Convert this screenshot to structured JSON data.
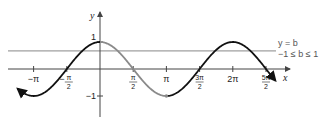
{
  "figure": {
    "function": "y = cos x",
    "highlight_interval": "[0, π]",
    "axes": {
      "x_label": "x",
      "y_label": "y"
    },
    "x_ticks": [
      {
        "value": -3.14159,
        "label": "−π",
        "kind": "plain"
      },
      {
        "value": -1.5708,
        "num": "π",
        "den": "2",
        "sign": "−",
        "kind": "frac"
      },
      {
        "value": 1.5708,
        "num": "π",
        "den": "2",
        "sign": "",
        "kind": "frac"
      },
      {
        "value": 3.14159,
        "label": "π",
        "kind": "plain"
      },
      {
        "value": 4.71239,
        "num": "3π",
        "den": "2",
        "sign": "",
        "kind": "frac"
      },
      {
        "value": 6.28319,
        "label": "2π",
        "kind": "plain"
      },
      {
        "value": 7.85398,
        "num": "5π",
        "den": "2",
        "sign": "",
        "kind": "frac"
      }
    ],
    "y_ticks": [
      {
        "value": 1,
        "label": "1"
      },
      {
        "value": -1,
        "label": "−1"
      }
    ],
    "horizontal_line": {
      "value": 0.67,
      "label_line1": "y = b",
      "label_line2": "−1 ≤ b ≤ 1"
    },
    "x_range": [
      -3.6,
      8.4
    ],
    "y_range": [
      -1.6,
      1.4
    ],
    "curve_domain": [
      -3.9,
      8.3
    ],
    "colors": {
      "curve": "#111111",
      "highlight": "#8a8a8a",
      "axes": "#444444",
      "hline": "#888888"
    }
  }
}
